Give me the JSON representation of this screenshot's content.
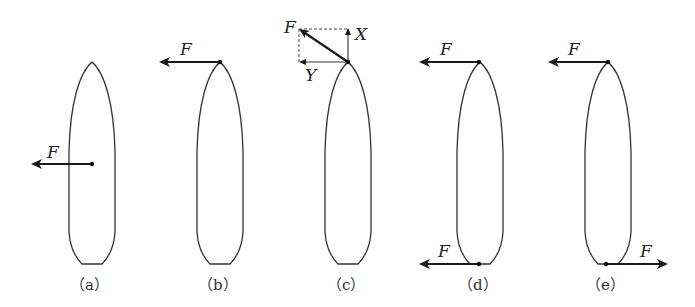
{
  "figure": {
    "panels": [
      {
        "id": "a",
        "caption": "（a）",
        "force_label": "F",
        "force_point": "midship",
        "direction": "left"
      },
      {
        "id": "b",
        "caption": "（b）",
        "force_label": "F",
        "force_point": "bow",
        "direction": "left"
      },
      {
        "id": "c",
        "caption": "（c）",
        "force_label": "F",
        "force_point": "bow",
        "direction": "oblique-up-left",
        "components": {
          "x_label": "X",
          "y_label": "Y"
        }
      },
      {
        "id": "d",
        "caption": "（d）",
        "force_labels": [
          "F",
          "F"
        ],
        "force_points": [
          "bow",
          "stern"
        ],
        "directions": [
          "left",
          "left"
        ]
      },
      {
        "id": "e",
        "caption": "（e）",
        "force_labels": [
          "F",
          "F"
        ],
        "force_points": [
          "bow",
          "stern"
        ],
        "directions": [
          "left",
          "right"
        ]
      }
    ]
  }
}
